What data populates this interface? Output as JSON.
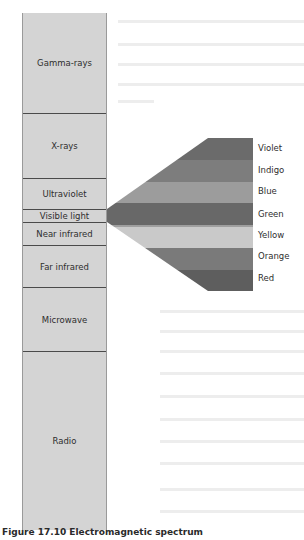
{
  "bands": [
    {
      "label": "Gamma-rays",
      "top": 0,
      "height": 100
    },
    {
      "label": "X-rays",
      "top": 100,
      "height": 65
    },
    {
      "label": "Ultraviolet",
      "top": 165,
      "height": 31
    },
    {
      "label": "Visible light",
      "top": 196,
      "height": 13
    },
    {
      "label": "Near infrared",
      "top": 209,
      "height": 23
    },
    {
      "label": "Far infrared",
      "top": 232,
      "height": 42
    },
    {
      "label": "Microwave",
      "top": 274,
      "height": 64
    },
    {
      "label": "Radio",
      "top": 338,
      "height": 179
    }
  ],
  "visible_spectrum": {
    "colors": [
      {
        "label": "Violet",
        "fill": "#6b6b6b"
      },
      {
        "label": "Indigo",
        "fill": "#7d7d7d"
      },
      {
        "label": "Blue",
        "fill": "#9c9c9c"
      },
      {
        "label": "Green",
        "fill": "#686868"
      },
      {
        "label": "Yellow",
        "fill": "#c9c9c9"
      },
      {
        "label": "Orange",
        "fill": "#7a7a7a"
      },
      {
        "label": "Red",
        "fill": "#5e5e5e"
      }
    ]
  },
  "caption": "Figure 17.10 Electromagnetic spectrum"
}
